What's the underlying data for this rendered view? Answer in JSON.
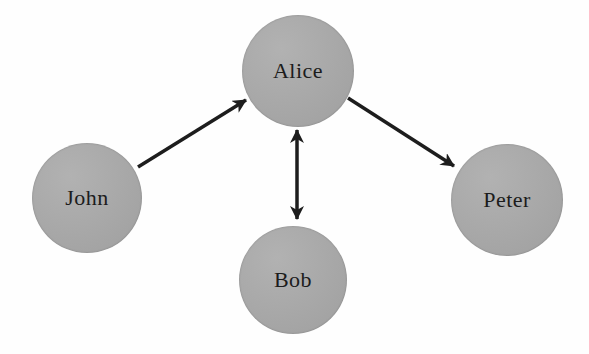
{
  "diagram": {
    "background_color": "#fefefe",
    "node_fill_color": "#a9a9a9",
    "node_text_color": "#1c1c1c",
    "arrow_color": "#1d1d1d",
    "arrow_stroke_width": 3.5,
    "nodes": [
      {
        "id": "john",
        "label": "John",
        "cx": 87,
        "cy": 198,
        "r": 55
      },
      {
        "id": "alice",
        "label": "Alice",
        "cx": 298,
        "cy": 71,
        "r": 56
      },
      {
        "id": "bob",
        "label": "Bob",
        "cx": 293,
        "cy": 280,
        "r": 54
      },
      {
        "id": "peter",
        "label": "Peter",
        "cx": 507,
        "cy": 200,
        "r": 56
      }
    ],
    "edges": [
      {
        "from": "john",
        "to": "alice",
        "direction": "single",
        "x1": 138,
        "y1": 167,
        "x2": 246,
        "y2": 100
      },
      {
        "from": "alice",
        "to": "bob",
        "direction": "double",
        "x1": 297,
        "y1": 130,
        "x2": 297,
        "y2": 219
      },
      {
        "from": "alice",
        "to": "peter",
        "direction": "single",
        "x1": 348,
        "y1": 98,
        "x2": 454,
        "y2": 166
      }
    ]
  }
}
